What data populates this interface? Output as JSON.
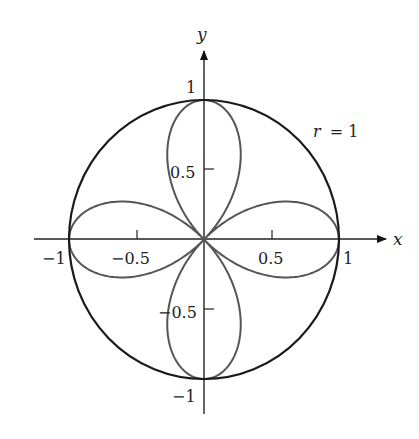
{
  "chart_data": {
    "type": "line",
    "title": "",
    "xlabel": "x",
    "ylabel": "y",
    "xlim": [
      -1.25,
      1.35
    ],
    "ylim": [
      -1.25,
      1.4
    ],
    "grid": false,
    "legend": null,
    "x_ticks": [
      -1,
      -0.5,
      0.5,
      1
    ],
    "x_tick_labels": [
      "−1",
      "−0.5",
      "0.5",
      "1"
    ],
    "y_ticks": [
      1,
      0.5,
      -0.5,
      -1
    ],
    "y_tick_labels": [
      "1",
      "0.5",
      "−0.5",
      "−1"
    ],
    "series": [
      {
        "name": "r = 1",
        "kind": "polar",
        "equation": "r = 1",
        "color": "#1a1a1a",
        "points_polar": {
          "theta_start": 0,
          "theta_end": 6.2832,
          "r": 1
        }
      },
      {
        "name": "r = cos 2θ",
        "kind": "polar",
        "equation": "r = cos(2θ)",
        "color": "#555555",
        "petals": 4,
        "petal_tips": [
          [
            1,
            0
          ],
          [
            0,
            1
          ],
          [
            -1,
            0
          ],
          [
            0,
            -1
          ]
        ]
      }
    ],
    "annotations": [
      {
        "text": "r = 1",
        "x": 0.82,
        "y": 0.75
      }
    ]
  },
  "labels": {
    "x_axis": "x",
    "y_axis": "y",
    "circle_annotation_r": "r",
    "circle_annotation_eq": "= 1",
    "xt_m1": "−1",
    "xt_m05": "−0.5",
    "xt_05": "0.5",
    "xt_1": "1",
    "yt_1": "1",
    "yt_05": "0.5",
    "yt_m05": "−0.5",
    "yt_m1": "−1"
  }
}
